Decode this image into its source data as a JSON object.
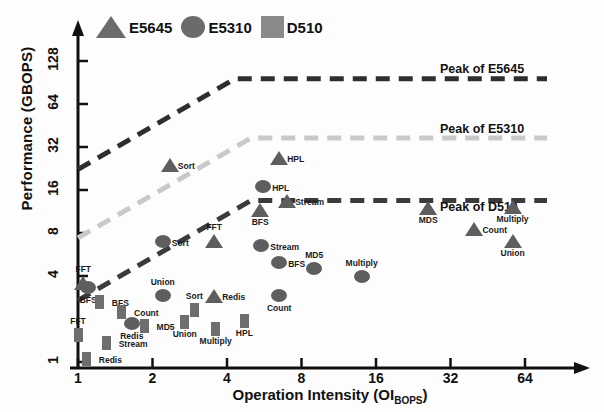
{
  "chart_data": {
    "type": "scatter",
    "title": "",
    "xlabel": "Operation Intensity (OI_BOPS)",
    "ylabel": "Performance (GBOPS)",
    "xscale": "log2",
    "yscale": "log2",
    "xlim": [
      1,
      64
    ],
    "ylim": [
      1,
      200
    ],
    "xticks": [
      1,
      2,
      4,
      8,
      16,
      32,
      64
    ],
    "xticklabels": [
      "1",
      "2",
      "4",
      "8",
      "16",
      "32",
      "64"
    ],
    "yticks": [
      1,
      4,
      8,
      16,
      32,
      64,
      128
    ],
    "yticklabels": [
      "1",
      "4",
      "8",
      "16",
      "32",
      "64",
      "128"
    ],
    "grid": false,
    "legend_position": "top-left",
    "legend": [
      {
        "label": "E5645",
        "marker": "triangle",
        "color": "#6b6b6b"
      },
      {
        "label": "E5310",
        "marker": "circle",
        "color": "#6b6b6b"
      },
      {
        "label": "D510",
        "marker": "square",
        "color": "#8a8a8a"
      }
    ],
    "rooflines": [
      {
        "name": "Peak of E5645",
        "peak": 96,
        "ridge_oi": 4.3,
        "color": "#2e2e2e",
        "label": "Peak of E5645"
      },
      {
        "name": "Peak of E5310",
        "peak": 37,
        "ridge_oi": 5.0,
        "color": "#c9c9c9",
        "label": "Peak of E5310"
      },
      {
        "name": "Peak of D510",
        "peak": 13.5,
        "ridge_oi": 5.0,
        "color": "#3b3b3b",
        "label": "Peak of D510"
      }
    ],
    "series": [
      {
        "name": "E5645",
        "marker": "triangle",
        "points": [
          {
            "label": "FFT",
            "x": 1.05,
            "y": 3.6
          },
          {
            "label": "Sort",
            "x": 2.35,
            "y": 24.0
          },
          {
            "label": "Redis",
            "x": 3.55,
            "y": 2.9
          },
          {
            "label": "FFT",
            "x": 3.55,
            "y": 7.0
          },
          {
            "label": "BFS",
            "x": 5.45,
            "y": 11.5
          },
          {
            "label": "HPL",
            "x": 6.5,
            "y": 27.0
          },
          {
            "label": "Stream",
            "x": 7.0,
            "y": 13.5
          },
          {
            "label": "MDS",
            "x": 26.0,
            "y": 12.0
          },
          {
            "label": "Count",
            "x": 40.0,
            "y": 8.5
          },
          {
            "label": "Multiply",
            "x": 57.0,
            "y": 12.2
          },
          {
            "label": "Union",
            "x": 57.0,
            "y": 7.0
          }
        ]
      },
      {
        "name": "E5310",
        "marker": "circle",
        "points": [
          {
            "label": "BFS",
            "x": 1.1,
            "y": 3.3
          },
          {
            "label": "Redis",
            "x": 1.65,
            "y": 1.85
          },
          {
            "label": "Sort",
            "x": 2.2,
            "y": 7.0
          },
          {
            "label": "Union",
            "x": 2.2,
            "y": 2.9
          },
          {
            "label": "Stream",
            "x": 5.5,
            "y": 6.5
          },
          {
            "label": "HPL",
            "x": 5.6,
            "y": 17.0
          },
          {
            "label": "BFS",
            "x": 6.5,
            "y": 5.0
          },
          {
            "label": "Count",
            "x": 6.5,
            "y": 2.9
          },
          {
            "label": "MD5",
            "x": 9.0,
            "y": 4.5
          },
          {
            "label": "Multiply",
            "x": 14.0,
            "y": 4.0
          }
        ]
      },
      {
        "name": "D510",
        "marker": "square",
        "points": [
          {
            "label": "FFT",
            "x": 1.0,
            "y": 1.55
          },
          {
            "label": "Redis",
            "x": 1.08,
            "y": 1.05
          },
          {
            "label": "BFS",
            "x": 1.22,
            "y": 2.65
          },
          {
            "label": "Stream",
            "x": 1.3,
            "y": 1.35
          },
          {
            "label": "Count",
            "x": 1.5,
            "y": 2.25
          },
          {
            "label": "MD5",
            "x": 1.85,
            "y": 1.8
          },
          {
            "label": "Union",
            "x": 2.7,
            "y": 1.9
          },
          {
            "label": "Sort",
            "x": 2.95,
            "y": 2.3
          },
          {
            "label": "Multiply",
            "x": 3.6,
            "y": 1.7
          },
          {
            "label": "HPL",
            "x": 4.7,
            "y": 1.95
          }
        ]
      }
    ]
  },
  "axes": {
    "x_title_main": "Operation Intensity (OI",
    "x_title_sub": "BOPS",
    "x_title_end": ")",
    "y_title": "Performance (GBOPS)"
  }
}
